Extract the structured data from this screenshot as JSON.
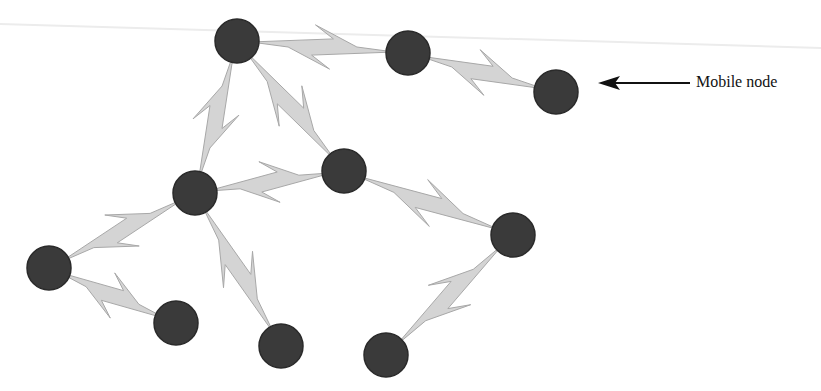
{
  "diagram": {
    "annotation": {
      "text": "Mobile node",
      "x": 696,
      "y": 73,
      "arrow_from": [
        690,
        83
      ],
      "arrow_to": [
        598,
        83
      ]
    },
    "colors": {
      "node_fill": "#3a3a3a",
      "node_stroke": "#2a2a2a",
      "link_fill": "#d4d4d4",
      "link_stroke": "#a8a8a8",
      "arrow": "#111111"
    },
    "node_radius": 22,
    "nodes": [
      {
        "id": "A",
        "x": 237,
        "y": 41
      },
      {
        "id": "B",
        "x": 408,
        "y": 53
      },
      {
        "id": "C",
        "x": 556,
        "y": 92,
        "mobile": true
      },
      {
        "id": "D",
        "x": 344,
        "y": 171
      },
      {
        "id": "E",
        "x": 195,
        "y": 193
      },
      {
        "id": "F",
        "x": 513,
        "y": 235
      },
      {
        "id": "G",
        "x": 49,
        "y": 268
      },
      {
        "id": "H",
        "x": 176,
        "y": 323
      },
      {
        "id": "I",
        "x": 281,
        "y": 346
      },
      {
        "id": "J",
        "x": 386,
        "y": 355
      }
    ],
    "links": [
      [
        "A",
        "B"
      ],
      [
        "B",
        "C"
      ],
      [
        "A",
        "E"
      ],
      [
        "A",
        "D"
      ],
      [
        "E",
        "D"
      ],
      [
        "D",
        "F"
      ],
      [
        "E",
        "G"
      ],
      [
        "G",
        "H"
      ],
      [
        "E",
        "I"
      ],
      [
        "F",
        "J"
      ]
    ]
  }
}
